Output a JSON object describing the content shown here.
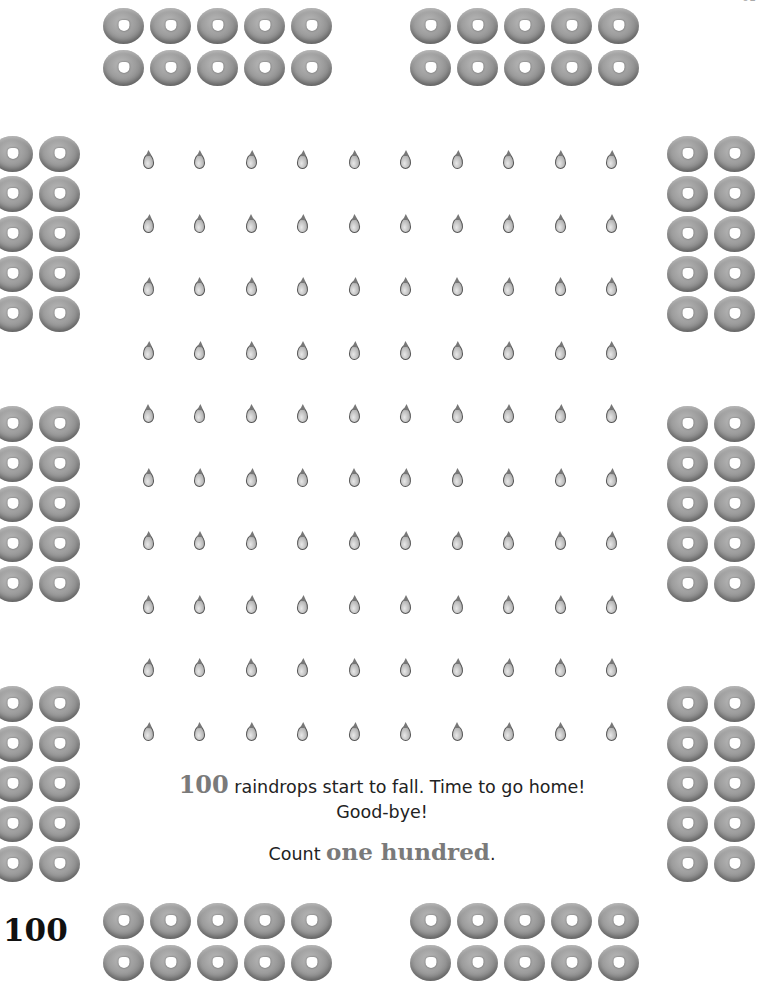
{
  "page": {
    "page_number": "100",
    "top_page_marker": "01"
  },
  "story": {
    "number": "100",
    "line1_rest": " raindrops start to fall. Time to go home!",
    "line2": "Good-bye!",
    "count_prefix": "Count ",
    "count_word": "one hundred",
    "count_suffix": "."
  },
  "illustrations": {
    "raindrops": {
      "rows": 10,
      "cols": 10,
      "total": 100,
      "icon": "raindrop-icon"
    },
    "donut_groups": [
      {
        "id": "top-left",
        "rows": 2,
        "cols": 5,
        "count": 10
      },
      {
        "id": "top-right",
        "rows": 2,
        "cols": 5,
        "count": 10
      },
      {
        "id": "left-1",
        "rows": 5,
        "cols": 2,
        "count": 10
      },
      {
        "id": "left-2",
        "rows": 5,
        "cols": 2,
        "count": 10
      },
      {
        "id": "left-3",
        "rows": 5,
        "cols": 2,
        "count": 10
      },
      {
        "id": "right-1",
        "rows": 5,
        "cols": 2,
        "count": 10
      },
      {
        "id": "right-2",
        "rows": 5,
        "cols": 2,
        "count": 10
      },
      {
        "id": "right-3",
        "rows": 5,
        "cols": 2,
        "count": 10
      },
      {
        "id": "bottom-left",
        "rows": 2,
        "cols": 5,
        "count": 10
      },
      {
        "id": "bottom-right",
        "rows": 2,
        "cols": 5,
        "count": 10
      }
    ],
    "donut_icon": "cereal-ring-icon"
  },
  "colors": {
    "number_accent": "#7a7a7a",
    "body_text": "#222222",
    "donut": "#9c9c9c"
  }
}
